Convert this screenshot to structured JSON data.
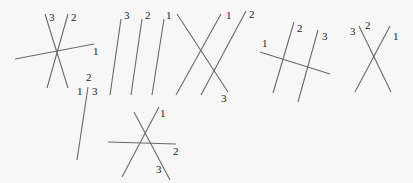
{
  "diagram": {
    "figures": [
      {
        "id": "fig-a",
        "lines": [
          {
            "label": "3",
            "x1": 45,
            "y1": 14,
            "x2": 68,
            "y2": 88,
            "lx": 49,
            "ly": 21
          },
          {
            "label": "2",
            "x1": 68,
            "y1": 14,
            "x2": 47,
            "y2": 88,
            "lx": 71,
            "ly": 21
          },
          {
            "label": "1",
            "x1": 15,
            "y1": 59,
            "x2": 94,
            "y2": 44,
            "lx": 93,
            "ly": 55
          }
        ]
      },
      {
        "id": "fig-b",
        "lines": [
          {
            "label": "2",
            "x1": 88,
            "y1": 87,
            "x2": 77,
            "y2": 160,
            "lx": 86,
            "ly": 81
          },
          {
            "label": "1",
            "x1": 0,
            "y1": 0,
            "x2": 0,
            "y2": 0,
            "lx": 77,
            "ly": 95
          },
          {
            "label": "3",
            "x1": 0,
            "y1": 0,
            "x2": 0,
            "y2": 0,
            "lx": 92,
            "ly": 95
          }
        ]
      },
      {
        "id": "fig-c",
        "lines": [
          {
            "label": "3",
            "x1": 121,
            "y1": 19,
            "x2": 110,
            "y2": 95,
            "lx": 124,
            "ly": 19
          },
          {
            "label": "2",
            "x1": 142,
            "y1": 19,
            "x2": 131,
            "y2": 95,
            "lx": 145,
            "ly": 19
          },
          {
            "label": "1",
            "x1": 164,
            "y1": 19,
            "x2": 152,
            "y2": 95,
            "lx": 166,
            "ly": 19
          }
        ]
      },
      {
        "id": "fig-d",
        "lines": [
          {
            "label": "3",
            "x1": 177,
            "y1": 14,
            "x2": 228,
            "y2": 92,
            "lx": 221,
            "ly": 102
          },
          {
            "label": "1",
            "x1": 221,
            "y1": 14,
            "x2": 176,
            "y2": 95,
            "lx": 226,
            "ly": 19
          },
          {
            "label": "2",
            "x1": 246,
            "y1": 11,
            "x2": 201,
            "y2": 95,
            "lx": 249,
            "ly": 18
          }
        ]
      },
      {
        "id": "fig-e",
        "lines": [
          {
            "label": "1",
            "x1": 260,
            "y1": 52,
            "x2": 330,
            "y2": 74,
            "lx": 262,
            "ly": 47
          },
          {
            "label": "2",
            "x1": 294,
            "y1": 22,
            "x2": 273,
            "y2": 93,
            "lx": 297,
            "ly": 32
          },
          {
            "label": "3",
            "x1": 318,
            "y1": 30,
            "x2": 298,
            "y2": 102,
            "lx": 322,
            "ly": 40
          }
        ]
      },
      {
        "id": "fig-f",
        "lines": [
          {
            "label": "2",
            "x1": 359,
            "y1": 26,
            "x2": 391,
            "y2": 92,
            "lx": 365,
            "ly": 29
          },
          {
            "label": "1",
            "x1": 390,
            "y1": 26,
            "x2": 355,
            "y2": 92,
            "lx": 393,
            "ly": 40
          },
          {
            "label": "3",
            "x1": 0,
            "y1": 0,
            "x2": 0,
            "y2": 0,
            "lx": 350,
            "ly": 35
          }
        ]
      },
      {
        "id": "fig-g",
        "lines": [
          {
            "label": "3",
            "x1": 134,
            "y1": 112,
            "x2": 170,
            "y2": 180,
            "lx": 156,
            "ly": 173
          },
          {
            "label": "1",
            "x1": 159,
            "y1": 107,
            "x2": 122,
            "y2": 177,
            "lx": 160,
            "ly": 117
          },
          {
            "label": "2",
            "x1": 108,
            "y1": 142,
            "x2": 176,
            "y2": 144,
            "lx": 173,
            "ly": 155
          }
        ]
      }
    ]
  }
}
